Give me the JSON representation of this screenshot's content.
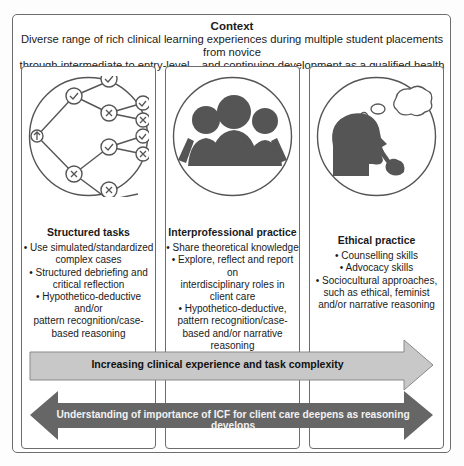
{
  "context": {
    "title": "Context",
    "line1": "Diverse range of rich clinical learning experiences during multiple student placements from novice",
    "line2": "through intermediate to entry-level – and continuing development as a qualified health professional"
  },
  "panels": [
    {
      "title": "Structured tasks",
      "icon": "decision-tree-icon",
      "bullets": [
        [
          "• Use simulated/standardized",
          "complex cases"
        ],
        [
          "• Structured debriefing and",
          "critical reflection"
        ],
        [
          "• Hypothetico-deductive and/or",
          "pattern recognition/case-",
          "based reasoning"
        ]
      ]
    },
    {
      "title": "Interprofessional practice",
      "icon": "group-people-icon",
      "bullets": [
        [
          "• Share theoretical knowledge"
        ],
        [
          "• Explore, reflect and report on",
          "interdisciplinary roles in",
          "client care"
        ],
        [
          "• Hypothetico-deductive,",
          "pattern recognition/case-",
          "based and/or narrative",
          "reasoning"
        ]
      ]
    },
    {
      "title": "Ethical practice",
      "icon": "thinking-head-icon",
      "bullets": [
        [
          "• Counselling skills"
        ],
        [
          "• Advocacy skills"
        ],
        [
          "• Sociocultural approaches,",
          "such as ethical, feminist",
          "and/or narrative reasoning"
        ]
      ]
    }
  ],
  "arrows": {
    "progress": {
      "label": "Increasing clinical experience and task complexity",
      "color": "#c8c8c8"
    },
    "understanding": {
      "label": "Understanding of importance of ICF for client care deepens as reasoning develops",
      "color": "#666666"
    }
  }
}
